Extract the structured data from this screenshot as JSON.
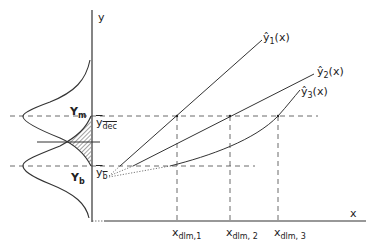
{
  "diagram": {
    "axes": {
      "y_label": "y",
      "x_label": "x"
    },
    "distributions": {
      "upper": {
        "label": "Y",
        "subscript": "m"
      },
      "lower": {
        "label": "Y",
        "subscript": "b"
      }
    },
    "levels": {
      "dec": {
        "label": "y",
        "subscript": "dec",
        "accent": "‾"
      },
      "b": {
        "label": "y",
        "subscript": "b",
        "accent": "‾"
      }
    },
    "curves": [
      {
        "name": "ŷ",
        "subscript": "1",
        "arg": "(x)"
      },
      {
        "name": "ŷ",
        "subscript": "2",
        "arg": "(x)"
      },
      {
        "name": "ŷ",
        "subscript": "3",
        "arg": "(x)"
      }
    ],
    "x_markers": [
      {
        "label": "x",
        "subscript": "dlm,1"
      },
      {
        "label": "x",
        "subscript": "dlm, 2"
      },
      {
        "label": "x",
        "subscript": "dlm, 3"
      }
    ],
    "line_color": "#333333",
    "hatch_color": "#333333"
  }
}
